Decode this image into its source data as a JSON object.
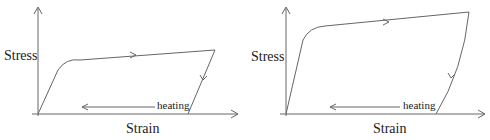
{
  "figure": {
    "panels": [
      {
        "id": "left",
        "ylabel": "Stress",
        "xlabel": "Strain",
        "annotation": "heating",
        "description": "Stress-strain loop: steep elastic loading, plateau with slight hardening, unloading line back to zero stress at residual strain, heating recovers strain back to origin"
      },
      {
        "id": "right",
        "ylabel": "Stress",
        "xlabel": "Strain",
        "annotation": "heating",
        "description": "Stress-strain loop with higher plateau and larger hardening, unloading curve back to zero stress, heating arrow pointing left"
      }
    ],
    "colors": {
      "line": "#666666",
      "text": "#222222",
      "background": "#ffffff"
    }
  }
}
